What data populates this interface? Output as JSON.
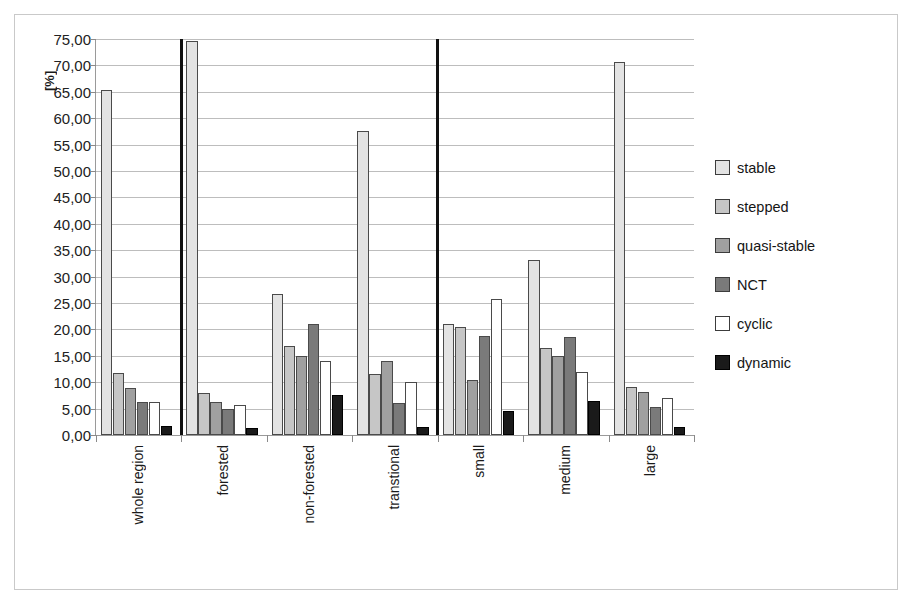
{
  "chart_data": {
    "type": "bar",
    "title": "",
    "subtitle": "",
    "xlabel": "",
    "ylabel": "[%]",
    "ylim": [
      0,
      75
    ],
    "ytick_step": 5,
    "ytick_labels": [
      "75,00",
      "70,00",
      "65,00",
      "60,00",
      "55,00",
      "50,00",
      "45,00",
      "40,00",
      "35,00",
      "30,00",
      "25,00",
      "20,00",
      "15,00",
      "10,00",
      "5,00",
      "0,00"
    ],
    "grid": true,
    "legend_position": "right",
    "categories": [
      "whole region",
      "forested",
      "non-forested",
      "transtional",
      "small",
      "medium",
      "large"
    ],
    "group_separators_after": [
      "whole region",
      "transtional"
    ],
    "series": [
      {
        "name": "stable",
        "color": "#e3e3e3",
        "values": [
          65.4,
          74.6,
          26.8,
          57.5,
          21.1,
          33.2,
          70.6
        ]
      },
      {
        "name": "stepped",
        "color": "#c6c6c6",
        "values": [
          11.8,
          8.0,
          16.9,
          11.6,
          20.5,
          16.4,
          9.0
        ]
      },
      {
        "name": "quasi-stable",
        "color": "#a0a0a0",
        "values": [
          8.9,
          6.3,
          15.0,
          14.1,
          10.4,
          15.0,
          8.1
        ]
      },
      {
        "name": "NCT",
        "color": "#7a7a7a",
        "values": [
          6.2,
          4.9,
          21.0,
          6.1,
          18.8,
          18.5,
          5.3
        ]
      },
      {
        "name": "cyclic",
        "color": "#ffffff",
        "values": [
          6.3,
          5.7,
          14.1,
          10.1,
          25.7,
          11.9,
          7.0
        ]
      },
      {
        "name": "dynamic",
        "color": "#1a1a1a",
        "values": [
          1.7,
          1.4,
          7.5,
          1.5,
          4.6,
          6.4,
          1.5
        ]
      }
    ]
  },
  "legend": {
    "items": [
      {
        "label": "stable"
      },
      {
        "label": "stepped"
      },
      {
        "label": "quasi-stable"
      },
      {
        "label": "NCT"
      },
      {
        "label": "cyclic"
      },
      {
        "label": "dynamic"
      }
    ]
  }
}
